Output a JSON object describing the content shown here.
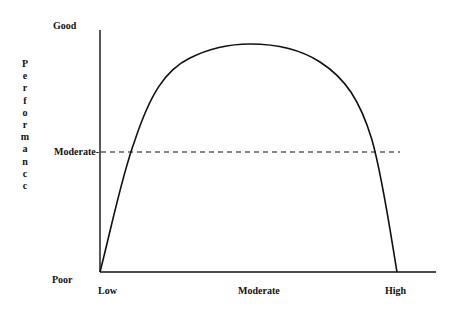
{
  "chart_data": {
    "type": "line",
    "title": "",
    "xlabel": "",
    "ylabel": "Performance",
    "ylabel_rendered": "Performancc",
    "x_ticks": [
      "Low",
      "Moderate",
      "High"
    ],
    "y_ticks": [
      "Poor",
      "Moderate",
      "Good"
    ],
    "grid": false,
    "legend": null,
    "annotations": [
      {
        "type": "dashed-horizontal-line",
        "y": "Moderate",
        "label": "Moderate-"
      }
    ],
    "series": [
      {
        "name": "performance-curve",
        "shape": "inverted-U",
        "x": [
          0,
          0.1,
          0.2,
          0.3,
          0.45,
          0.5,
          0.6,
          0.7,
          0.8,
          0.9,
          0.95,
          1.0
        ],
        "y": [
          0,
          0.52,
          0.8,
          0.93,
          0.99,
          1.0,
          0.99,
          0.93,
          0.8,
          0.52,
          0.3,
          0
        ],
        "x_scale": "0=Low, 0.5=Moderate, 1=High (approx; curve returns to Poor at ~0.96)",
        "y_scale": "0=Poor, 0.5=Moderate, 1=Good"
      }
    ],
    "xlim": [
      "Low",
      "High"
    ],
    "ylim": [
      "Poor",
      "Good"
    ]
  },
  "axes": {
    "y_title": "Performanc c",
    "y_top": "Good",
    "y_mid": "Moderate-",
    "y_bottom": "Poor",
    "x_left": "Low",
    "x_mid": "Moderate",
    "x_right": "High"
  }
}
